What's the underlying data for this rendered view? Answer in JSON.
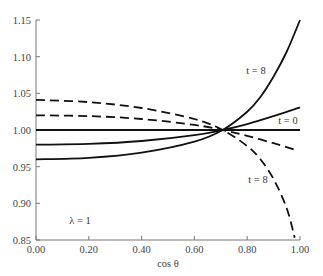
{
  "chart_data": {
    "type": "line",
    "title": "",
    "xlabel": "cos θ",
    "ylabel": "",
    "xlim": [
      0.0,
      1.0
    ],
    "ylim": [
      0.85,
      1.15
    ],
    "grid": false,
    "legend": null,
    "x_ticks": [
      "0.00",
      "0.20",
      "0.40",
      "0.60",
      "0.80",
      "1.00"
    ],
    "y_ticks": [
      "0.85",
      "0.90",
      "0.95",
      "1.00",
      "1.05",
      "1.10",
      "1.15"
    ],
    "annotations": [
      {
        "text": "t = 8",
        "x": 0.9,
        "y": 1.095
      },
      {
        "text": "t = 0",
        "x": 0.93,
        "y": 1.013
      },
      {
        "text": "t = 8",
        "x": 0.88,
        "y": 0.935
      },
      {
        "text": "λ = 1",
        "x": 0.09,
        "y": 0.875
      }
    ],
    "series": [
      {
        "name": "solid t=0 (flat)",
        "style": "solid",
        "x": [
          0.0,
          0.2,
          0.4,
          0.6,
          0.707,
          0.8,
          0.9,
          1.0
        ],
        "y": [
          1.0,
          1.0,
          1.0,
          1.0,
          1.0,
          1.0,
          1.0,
          1.0
        ]
      },
      {
        "name": "solid intermediate",
        "style": "solid",
        "x": [
          0.0,
          0.2,
          0.4,
          0.6,
          0.707,
          0.8,
          0.9,
          1.0
        ],
        "y": [
          0.98,
          0.981,
          0.985,
          0.993,
          1.0,
          1.008,
          1.019,
          1.031
        ]
      },
      {
        "name": "solid t=8",
        "style": "solid",
        "x": [
          0.0,
          0.2,
          0.4,
          0.6,
          0.707,
          0.8,
          0.85,
          0.9,
          0.95,
          1.0
        ],
        "y": [
          0.96,
          0.962,
          0.969,
          0.984,
          1.0,
          1.025,
          1.045,
          1.073,
          1.107,
          1.15
        ]
      },
      {
        "name": "dashed intermediate",
        "style": "dashed",
        "x": [
          0.0,
          0.2,
          0.4,
          0.6,
          0.707,
          0.8,
          0.9,
          0.98
        ],
        "y": [
          1.02,
          1.019,
          1.015,
          1.007,
          1.0,
          0.992,
          0.982,
          0.973
        ]
      },
      {
        "name": "dashed t=8",
        "style": "dashed",
        "x": [
          0.0,
          0.2,
          0.4,
          0.6,
          0.707,
          0.8,
          0.85,
          0.9,
          0.95,
          0.98
        ],
        "y": [
          1.041,
          1.038,
          1.03,
          1.015,
          1.0,
          0.978,
          0.96,
          0.933,
          0.893,
          0.853
        ]
      }
    ]
  },
  "labels": {
    "xlabel": "cos θ",
    "t8_upper": "t = 8",
    "t0": "t = 0",
    "t8_lower": "t = 8",
    "lambda": "λ = 1"
  }
}
